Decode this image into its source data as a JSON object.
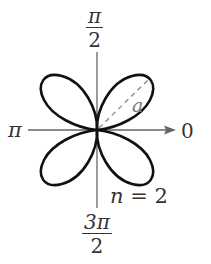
{
  "diagram": {
    "curve_label": "n = 2",
    "curve_label_var": "n",
    "curve_label_eq": "= 2",
    "petal_length_label": "a",
    "angle_labels": {
      "top": {
        "numerator": "π",
        "denominator": "2"
      },
      "left": "π",
      "right": "0",
      "bottom": {
        "numerator": "3π",
        "denominator": "2"
      }
    },
    "petal_count": 4,
    "colors": {
      "curve": "#111111",
      "axes": "#555555",
      "dashed": "#888888",
      "text": "#333333"
    }
  }
}
